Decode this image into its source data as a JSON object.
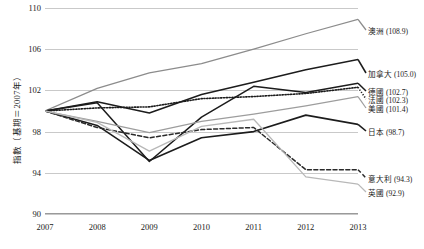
{
  "chart_data": {
    "type": "line",
    "title": "",
    "xlabel": "",
    "ylabel": "指數（基期＝2007年）",
    "x": [
      2007,
      2008,
      2009,
      2010,
      2011,
      2012,
      2013
    ],
    "xticklabels": [
      "2007",
      "2008",
      "2009",
      "2010",
      "2011",
      "2012",
      "2013"
    ],
    "ylim": [
      90,
      110
    ],
    "yticks": [
      90,
      94,
      98,
      102,
      106,
      110
    ],
    "yticklabels": [
      "90",
      "94",
      "98",
      "102",
      "106",
      "110"
    ],
    "grid": true,
    "legend_position": "right-end-labels",
    "series": [
      {
        "name": "澳洲",
        "final_value": "108.9",
        "label": "澳洲 (108.9)",
        "color": "#8c8c8c",
        "style": "solid",
        "width": 1.3,
        "values": [
          100.0,
          102.2,
          103.7,
          104.6,
          106.0,
          107.5,
          108.9
        ],
        "label_y": 30
      },
      {
        "name": "加拿大",
        "final_value": "105.0",
        "label": "加拿大 (105.0)",
        "color": "#1c1c1c",
        "style": "solid",
        "width": 1.5,
        "values": [
          100.0,
          100.9,
          99.8,
          101.6,
          102.8,
          104.0,
          105.0
        ],
        "label_y": 73
      },
      {
        "name": "德國",
        "final_value": "102.7",
        "label": "德國 (102.7)",
        "color": "#1c1c1c",
        "style": "solid",
        "width": 1.5,
        "values": [
          100.0,
          100.8,
          95.1,
          99.4,
          102.4,
          101.8,
          102.7
        ],
        "label_y": 91
      },
      {
        "name": "法國",
        "final_value": "102.3",
        "label": "法國 (102.3)",
        "color": "#1c1c1c",
        "style": "dotted",
        "width": 1.6,
        "values": [
          100.0,
          100.3,
          100.4,
          101.2,
          101.4,
          101.7,
          102.3
        ],
        "label_y": 99
      },
      {
        "name": "美國",
        "final_value": "101.4",
        "label": "美國 (101.4)",
        "color": "#9d9d9d",
        "style": "solid",
        "width": 1.2,
        "values": [
          100.0,
          99.0,
          97.9,
          99.0,
          99.7,
          100.5,
          101.4
        ],
        "label_y": 108
      },
      {
        "name": "日本",
        "final_value": "98.7",
        "label": "日本 (98.7)",
        "color": "#1c1c1c",
        "style": "solid",
        "width": 1.6,
        "values": [
          100.0,
          98.6,
          95.2,
          97.4,
          98.0,
          99.6,
          98.7
        ],
        "label_y": 131
      },
      {
        "name": "意大利",
        "final_value": "94.3",
        "label": "意大利 (94.3)",
        "color": "#2a2a2a",
        "style": "dashed",
        "width": 1.5,
        "values": [
          100.0,
          98.4,
          97.4,
          98.2,
          98.4,
          94.3,
          94.3
        ],
        "label_y": 178
      },
      {
        "name": "英國",
        "final_value": "92.9",
        "label": "英國 (92.9)",
        "color": "#b8b8b8",
        "style": "solid",
        "width": 1.3,
        "values": [
          100.0,
          98.9,
          96.1,
          98.5,
          99.2,
          93.6,
          92.9
        ],
        "label_y": 192
      }
    ]
  }
}
